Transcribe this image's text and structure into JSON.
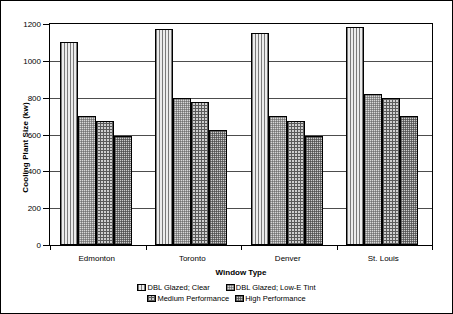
{
  "chart_data": {
    "type": "bar",
    "title": "",
    "subtitle": "",
    "xlabel": "Window Type",
    "ylabel": "Cooling Plant Size (kw)",
    "categories": [
      "Edmonton",
      "Toronto",
      "Denver",
      "St. Louis"
    ],
    "series": [
      {
        "name": "DBL Glazed; Clear",
        "values": [
          1100,
          1175,
          1150,
          1185
        ],
        "fill": "vertical-lines"
      },
      {
        "name": "DBL Glazed; Low-E Tint",
        "values": [
          700,
          800,
          700,
          820
        ],
        "fill": "fine-checker"
      },
      {
        "name": "Medium Performance",
        "values": [
          675,
          775,
          675,
          800
        ],
        "fill": "crosshatch"
      },
      {
        "name": "High Performance",
        "values": [
          590,
          625,
          590,
          700
        ],
        "fill": "dense-dots"
      }
    ],
    "ylim": [
      0,
      1200
    ],
    "ytick_values": [
      0,
      200,
      400,
      600,
      800,
      1000,
      1200
    ],
    "ytick_labels": [
      "0",
      "200",
      "400",
      "600",
      "800",
      "1000",
      "1200"
    ],
    "grid": true,
    "grid_axis": "y",
    "legend_position": "bottom",
    "legend_columns": 2,
    "bar_edge_color": "#000000",
    "grid_color": "#4d4d4d",
    "background": "#ffffff"
  }
}
